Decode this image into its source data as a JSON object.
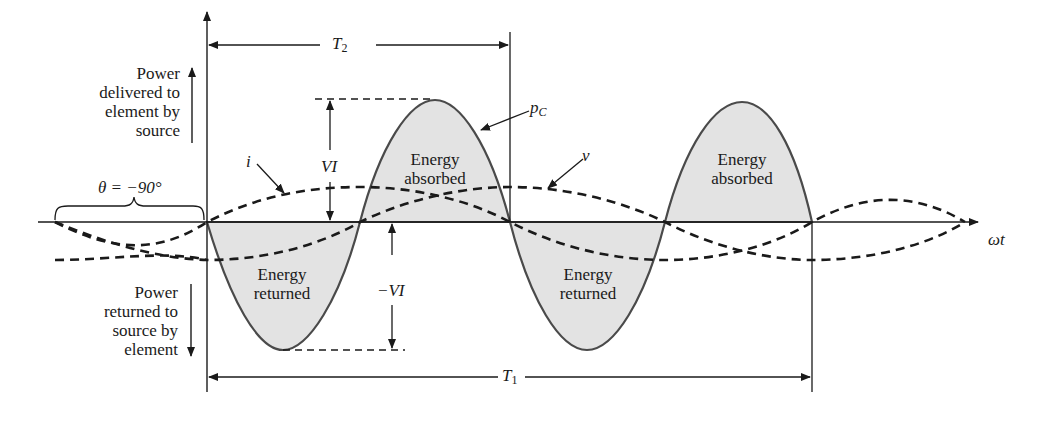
{
  "diagram": {
    "labels": {
      "power_delivered": [
        "Power",
        "delivered to",
        "element by",
        "source"
      ],
      "power_returned": [
        "Power",
        "returned to",
        "source by",
        "element"
      ],
      "theta": "θ = −90°",
      "current": "i",
      "voltage": "v",
      "power_curve": "p",
      "power_curve_sub": "C",
      "peak_positive": "VI",
      "peak_negative": "−VI",
      "period_T2": "T",
      "period_T2_sub": "2",
      "period_T1": "T",
      "period_T1_sub": "1",
      "x_axis": "ωt",
      "energy_absorbed": [
        "Energy",
        "absorbed"
      ],
      "energy_returned": [
        "Energy",
        "returned"
      ]
    },
    "colors": {
      "fill": "#e3e3e3",
      "stroke": "#3a3a3a",
      "line": "#1a1a1a"
    }
  }
}
